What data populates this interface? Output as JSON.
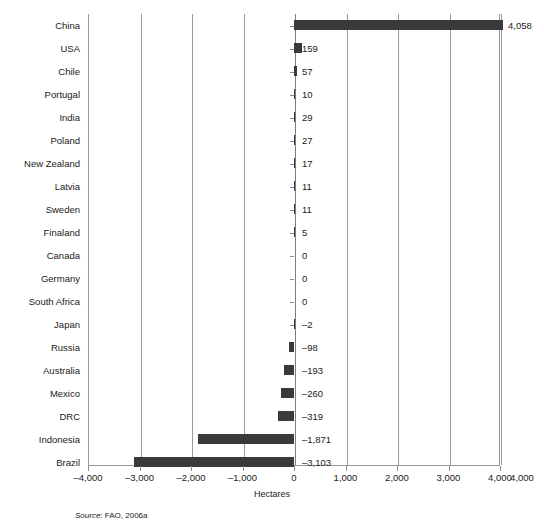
{
  "chart_data": {
    "type": "bar",
    "orientation": "horizontal",
    "title": "",
    "subtitle": "",
    "xlabel": "Hectares",
    "ylabel": "",
    "xlim": [
      -4000,
      4000
    ],
    "xticks": [
      -4000,
      -3000,
      -2000,
      -1000,
      0,
      1000,
      2000,
      3000,
      4000,
      4000
    ],
    "xtick_labels": [
      "–4,000",
      "–3,000",
      "–2,000",
      "–1,000",
      "0",
      "1,000",
      "2,000",
      "3,000",
      "4,000",
      "4,000"
    ],
    "grid": "vertical",
    "legend": "none",
    "bar_color": "#3a3a3a",
    "categories": [
      "China",
      "USA",
      "Chile",
      "Portugal",
      "India",
      "Poland",
      "New Zealand",
      "Latvia",
      "Sweden",
      "Finaland",
      "Canada",
      "Germany",
      "South Africa",
      "Japan",
      "Russia",
      "Australia",
      "Mexico",
      "DRC",
      "Indonesia",
      "Brazil"
    ],
    "values": [
      4058,
      159,
      57,
      10,
      29,
      27,
      17,
      11,
      11,
      5,
      0,
      0,
      0,
      -2,
      -98,
      -193,
      -260,
      -319,
      -1871,
      -3103
    ],
    "data_labels": [
      "4,058",
      "159",
      "57",
      "10",
      "29",
      "27",
      "17",
      "11",
      "11",
      "5",
      "0",
      "0",
      "0",
      "–2",
      "–98",
      "–193",
      "–260",
      "–319",
      "–1,871",
      "–3,103"
    ],
    "annotations": []
  },
  "source": {
    "label": "Source",
    "separator": ": ",
    "text": "FAO, 2006a"
  }
}
